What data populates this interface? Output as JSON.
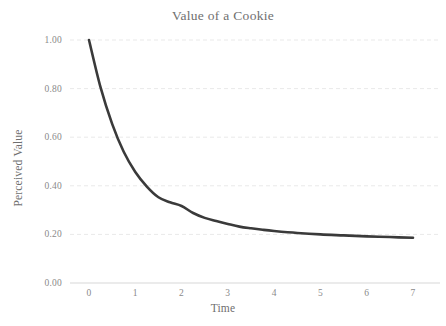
{
  "chart_data": {
    "type": "line",
    "title": "Value of a Cookie",
    "xlabel": "Time",
    "ylabel": "Perceived Value",
    "xlim": [
      0,
      7
    ],
    "ylim": [
      0.0,
      1.0
    ],
    "grid": true,
    "grid_axis": "y",
    "legend": "none",
    "xticks": [
      "0",
      "1",
      "2",
      "3",
      "4",
      "5",
      "6",
      "7"
    ],
    "xtick_values": [
      0,
      1,
      2,
      3,
      4,
      5,
      6,
      7
    ],
    "yticks": [
      "0.00",
      "0.20",
      "0.40",
      "0.60",
      "0.80",
      "1.00"
    ],
    "ytick_values": [
      0.0,
      0.2,
      0.4,
      0.6,
      0.8,
      1.0
    ],
    "series": [
      {
        "name": "Perceived Value",
        "color": "#3a3a3a",
        "line_width": 2.6,
        "x": [
          0,
          0.25,
          0.5,
          0.75,
          1,
          1.25,
          1.5,
          1.75,
          2,
          2.25,
          2.5,
          2.75,
          3,
          3.25,
          3.5,
          3.75,
          4,
          4.5,
          5,
          5.5,
          6,
          6.5,
          7
        ],
        "y": [
          1.0,
          0.805,
          0.655,
          0.54,
          0.457,
          0.397,
          0.353,
          0.332,
          0.317,
          0.288,
          0.268,
          0.255,
          0.243,
          0.232,
          0.225,
          0.219,
          0.214,
          0.206,
          0.2,
          0.196,
          0.192,
          0.189,
          0.186
        ]
      }
    ]
  },
  "colors": {
    "line": "#3a3a3a",
    "grid": "#e9e9e9",
    "axis": "#d8d8d8",
    "text": "#8a8a8a",
    "title_text": "#6f6f6f",
    "background": "#ffffff"
  }
}
